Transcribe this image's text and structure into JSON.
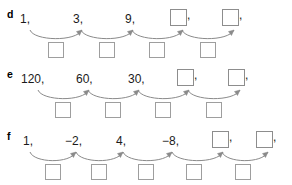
{
  "page": {
    "background": "#ffffff",
    "ink": "#1a1a1a",
    "box_border": "#9a9a9a",
    "arrow_color": "#8a8a8a"
  },
  "rows": [
    {
      "label": "d",
      "terms": [
        {
          "text": "1,",
          "type": "number",
          "x": 20,
          "comma": true
        },
        {
          "text": "3,",
          "type": "number",
          "x": 73,
          "comma": true
        },
        {
          "text": "9,",
          "type": "number",
          "x": 125,
          "comma": true
        },
        {
          "text": "",
          "type": "box",
          "x": 170,
          "comma": true
        },
        {
          "text": "",
          "type": "box",
          "x": 222,
          "comma": true
        }
      ],
      "answer_boxes": [
        {
          "x": 48,
          "y": 42
        },
        {
          "x": 99,
          "y": 42
        },
        {
          "x": 149,
          "y": 42
        },
        {
          "x": 200,
          "y": 42
        }
      ],
      "arrows": [
        {
          "x1": 30,
          "y1": 30,
          "x2": 82,
          "y2": 30
        },
        {
          "x1": 81,
          "y1": 30,
          "x2": 133,
          "y2": 30
        },
        {
          "x1": 132,
          "y1": 30,
          "x2": 183,
          "y2": 30
        },
        {
          "x1": 182,
          "y1": 30,
          "x2": 234,
          "y2": 30
        }
      ]
    },
    {
      "label": "e",
      "terms": [
        {
          "text": "120,",
          "type": "number",
          "x": 21,
          "comma": true
        },
        {
          "text": "60,",
          "type": "number",
          "x": 76,
          "comma": true
        },
        {
          "text": "30,",
          "type": "number",
          "x": 128,
          "comma": true
        },
        {
          "text": "",
          "type": "box",
          "x": 177,
          "comma": true
        },
        {
          "text": "",
          "type": "box",
          "x": 228,
          "comma": true
        }
      ],
      "answer_boxes": [
        {
          "x": 55,
          "y": 42
        },
        {
          "x": 105,
          "y": 42
        },
        {
          "x": 155,
          "y": 42
        },
        {
          "x": 206,
          "y": 42
        }
      ],
      "arrows": [
        {
          "x1": 38,
          "y1": 30,
          "x2": 89,
          "y2": 30
        },
        {
          "x1": 88,
          "y1": 30,
          "x2": 139,
          "y2": 30
        },
        {
          "x1": 138,
          "y1": 30,
          "x2": 189,
          "y2": 30
        },
        {
          "x1": 188,
          "y1": 30,
          "x2": 240,
          "y2": 30
        }
      ]
    },
    {
      "label": "f",
      "terms": [
        {
          "text": "1,",
          "type": "number",
          "x": 23,
          "comma": true
        },
        {
          "text": "−2,",
          "type": "number",
          "x": 65,
          "comma": true
        },
        {
          "text": "4,",
          "type": "number",
          "x": 116,
          "comma": true
        },
        {
          "text": "−8,",
          "type": "number",
          "x": 162,
          "comma": true
        },
        {
          "text": "",
          "type": "box",
          "x": 212,
          "comma": true
        },
        {
          "text": "",
          "type": "box",
          "x": 256,
          "comma": true
        }
      ],
      "answer_boxes": [
        {
          "x": 45,
          "y": 42
        },
        {
          "x": 91,
          "y": 42
        },
        {
          "x": 138,
          "y": 42
        },
        {
          "x": 186,
          "y": 42
        },
        {
          "x": 235,
          "y": 42
        }
      ],
      "arrows": [
        {
          "x1": 30,
          "y1": 30,
          "x2": 76,
          "y2": 30
        },
        {
          "x1": 76,
          "y1": 30,
          "x2": 123,
          "y2": 30
        },
        {
          "x1": 123,
          "y1": 30,
          "x2": 172,
          "y2": 30
        },
        {
          "x1": 172,
          "y1": 30,
          "x2": 223,
          "y2": 30
        },
        {
          "x1": 222,
          "y1": 30,
          "x2": 268,
          "y2": 30
        }
      ]
    }
  ]
}
